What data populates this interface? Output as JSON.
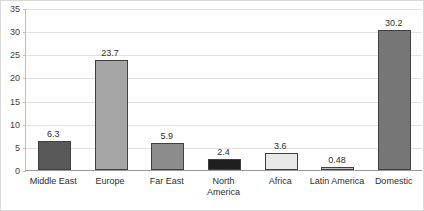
{
  "chart_data": {
    "type": "bar",
    "title": "",
    "subtitle": "",
    "xlabel": "",
    "ylabel": "",
    "categories": [
      "Middle East",
      "Europe",
      "Far East",
      "North America",
      "Africa",
      "Latin America",
      "Domestic"
    ],
    "values": [
      6.3,
      23.7,
      5.9,
      2.4,
      3.6,
      0.48,
      30.2
    ],
    "value_labels": [
      "6.3",
      "23.7",
      "5.9",
      "2.4",
      "3.6",
      "0.48",
      "30.2"
    ],
    "bar_colors": [
      "#595959",
      "#a6a6a6",
      "#8c8c8c",
      "#1f1f1f",
      "#e8e8e8",
      "#bfbfbf",
      "#767676"
    ],
    "bar_border_color": "#404040",
    "ylim": [
      0,
      35
    ],
    "yticks": [
      0,
      5,
      10,
      15,
      20,
      25,
      30,
      35
    ],
    "ytick_labels": [
      "0",
      "5",
      "10",
      "15",
      "20",
      "25",
      "30",
      "35"
    ],
    "grid": true,
    "grid_color": "#e2e2e2",
    "legend": false,
    "legend_position": "none",
    "series": [
      {
        "name": "",
        "values": [
          6.3,
          23.7,
          5.9,
          2.4,
          3.6,
          0.48,
          30.2
        ]
      }
    ]
  }
}
